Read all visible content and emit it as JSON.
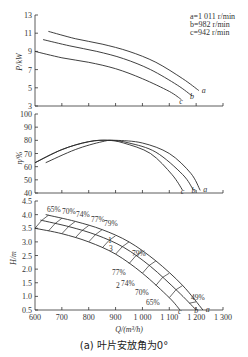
{
  "caption": "(a) 叶片安放角为0°",
  "legend": {
    "a": "a=1 011 r/min",
    "b": "b=982 r/min",
    "c": "c=942 r/min"
  },
  "chart_data": [
    {
      "type": "line",
      "title": "",
      "xlabel": "Q/(m³/h)",
      "ylabel": "P/kW",
      "xlim": [
        600,
        1300
      ],
      "ylim": [
        3,
        13
      ],
      "yticks": [
        3,
        5,
        7,
        9,
        11,
        13
      ],
      "series": [
        {
          "name": "a",
          "x": [
            650,
            750,
            850,
            950,
            1050,
            1150,
            1210
          ],
          "values": [
            11.2,
            10.4,
            9.8,
            9.0,
            7.8,
            6.0,
            4.7
          ]
        },
        {
          "name": "b",
          "x": [
            630,
            730,
            830,
            930,
            1030,
            1130,
            1185
          ],
          "values": [
            10.3,
            9.6,
            9.0,
            8.2,
            7.0,
            5.3,
            4.1
          ]
        },
        {
          "name": "c",
          "x": [
            600,
            700,
            800,
            900,
            1000,
            1100,
            1145
          ],
          "values": [
            9.0,
            8.3,
            7.8,
            7.1,
            6.0,
            4.6,
            3.7
          ]
        }
      ],
      "legend_position": "top-right"
    },
    {
      "type": "line",
      "title": "",
      "xlabel": "Q/(m³/h)",
      "ylabel": "η/%",
      "xlim": [
        600,
        1300
      ],
      "ylim": [
        40,
        100
      ],
      "yticks": [
        40,
        50,
        60,
        70,
        80,
        90,
        100
      ],
      "series": [
        {
          "name": "a",
          "x": [
            640,
            750,
            850,
            900,
            1000,
            1100,
            1180,
            1215
          ],
          "values": [
            63,
            73,
            79,
            80,
            78,
            70,
            55,
            42
          ]
        },
        {
          "name": "b",
          "x": [
            600,
            700,
            800,
            880,
            950,
            1050,
            1150,
            1190
          ],
          "values": [
            63,
            73,
            79,
            80,
            78,
            71,
            54,
            42
          ]
        },
        {
          "name": "c",
          "x": [
            600,
            700,
            800,
            870,
            930,
            1030,
            1110,
            1150
          ],
          "values": [
            63,
            73,
            79,
            80,
            78,
            70,
            54,
            42
          ]
        }
      ]
    },
    {
      "type": "line",
      "title": "",
      "xlabel": "Q/(m³/h)",
      "ylabel": "H/m",
      "xlim": [
        600,
        1300
      ],
      "ylim": [
        0.5,
        4.5
      ],
      "xticks": [
        "600",
        "700",
        "800",
        "900",
        "1 000",
        "1 100",
        "1 200",
        "1 300"
      ],
      "yticks": [
        0.5,
        1.0,
        1.5,
        2.0,
        2.5,
        3.0,
        3.5,
        4.0,
        4.5
      ],
      "series": [
        {
          "name": "a",
          "x": [
            640,
            750,
            850,
            950,
            1050,
            1150,
            1225
          ],
          "values": [
            4.0,
            3.75,
            3.45,
            3.0,
            2.3,
            1.4,
            0.5
          ]
        },
        {
          "name": "b",
          "x": [
            620,
            730,
            830,
            930,
            1030,
            1130,
            1200
          ],
          "values": [
            3.8,
            3.55,
            3.25,
            2.8,
            2.1,
            1.2,
            0.5
          ]
        },
        {
          "name": "c",
          "x": [
            600,
            700,
            800,
            900,
            1000,
            1100,
            1140
          ],
          "values": [
            3.5,
            3.3,
            3.0,
            2.55,
            1.85,
            0.95,
            0.5
          ]
        }
      ],
      "annotations": [
        "65%",
        "70%",
        "74%",
        "77%",
        "79%",
        "79%",
        "77%",
        "74%",
        "70%",
        "65%",
        "49%",
        "1",
        "2",
        "3"
      ]
    }
  ],
  "axes": {
    "p_ylabel": "P/kW",
    "eta_ylabel": "η/%",
    "h_ylabel": "H/m",
    "xlabel": "Q/(m³/h)"
  }
}
